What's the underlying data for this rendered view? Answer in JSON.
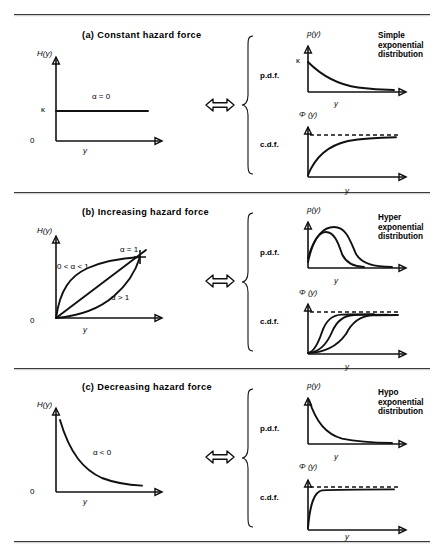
{
  "figure": {
    "panels": [
      {
        "id": "a",
        "title": "(a)   Constant  hazard  force",
        "hazard": {
          "ylabel": "H(y)",
          "xlabel": "y",
          "origin_label": "0",
          "ytick_label": "κ",
          "curve_labels": [
            "α = 0"
          ]
        },
        "equiv_icon": "double-headed-arrow",
        "brace_labels": {
          "pdf": "p.d.f.",
          "cdf": "c.d.f."
        },
        "pdf": {
          "ylabel": "p(y)",
          "xlabel": "y",
          "ytick_label": "κ"
        },
        "cdf": {
          "ylabel": "Φ (y)",
          "xlabel": "y"
        },
        "distribution": "Simple\nexponential\ndistribution",
        "distribution_lines": [
          "Simple",
          "exponential",
          "distribution"
        ]
      },
      {
        "id": "b",
        "title": "(b)   Increasing  hazard  force",
        "hazard": {
          "ylabel": "H(y)",
          "xlabel": "y",
          "origin_label": "0",
          "ytick_label": "",
          "curve_labels": [
            "0 < α < 1",
            "α = 1",
            "α > 1"
          ]
        },
        "equiv_icon": "double-headed-arrow",
        "brace_labels": {
          "pdf": "p.d.f.",
          "cdf": "c.d.f."
        },
        "pdf": {
          "ylabel": "p(y)",
          "xlabel": "y",
          "ytick_label": ""
        },
        "cdf": {
          "ylabel": "Φ (y)",
          "xlabel": "y"
        },
        "distribution": "Hyper\nexponential\ndistribution",
        "distribution_lines": [
          "Hyper",
          "exponential",
          "distribution"
        ]
      },
      {
        "id": "c",
        "title": "(c)   Decreasing  hazard  force",
        "hazard": {
          "ylabel": "H(y)",
          "xlabel": "y",
          "origin_label": "0",
          "ytick_label": "",
          "curve_labels": [
            "α < 0"
          ]
        },
        "equiv_icon": "double-headed-arrow",
        "brace_labels": {
          "pdf": "p.d.f.",
          "cdf": "c.d.f."
        },
        "pdf": {
          "ylabel": "p(y)",
          "xlabel": "y",
          "ytick_label": ""
        },
        "cdf": {
          "ylabel": "Φ (y)",
          "xlabel": "y"
        },
        "distribution": "Hypo\nexponential\ndistribution",
        "distribution_lines": [
          "Hypo",
          "exponential",
          "distribution"
        ]
      }
    ],
    "colors": {
      "ink": "#111111",
      "rule": "#3a3a3a",
      "paper": "#ffffff"
    }
  }
}
